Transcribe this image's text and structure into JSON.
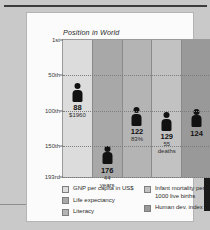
{
  "figure": {
    "title": "Position in World"
  },
  "chart_data": {
    "type": "bar",
    "title": "Position in World",
    "xlabel": "",
    "ylabel": "Position in World",
    "ylim": [
      1,
      193
    ],
    "grid": true,
    "legend_position": "bottom",
    "y_ticks": [
      {
        "label": "1st",
        "value": 1
      },
      {
        "label": "50th",
        "value": 50
      },
      {
        "label": "100th",
        "value": 100
      },
      {
        "label": "150th",
        "value": 150
      },
      {
        "label": "193rd",
        "value": 193
      }
    ],
    "categories": [
      "GNP per capita in US$",
      "Life expectancy",
      "Literacy",
      "Infant mortality per 1000 live births",
      "Human dev. index"
    ],
    "values": [
      88,
      176,
      122,
      129,
      124
    ],
    "point_labels": [
      {
        "rank": "88",
        "sub1": "$1960",
        "sub2": ""
      },
      {
        "rank": "176",
        "sub1": "44",
        "sub2": "years"
      },
      {
        "rank": "122",
        "sub1": "83%",
        "sub2": ""
      },
      {
        "rank": "129",
        "sub1": "55",
        "sub2": "deaths"
      },
      {
        "rank": "124",
        "sub1": "",
        "sub2": ""
      }
    ],
    "column_colors": [
      "#dcdcdc",
      "#a8a8a8",
      "#b4b4b4",
      "#c2c2c2",
      "#999999"
    ]
  },
  "legend": {
    "left": [
      {
        "label": "GNP per capita in US$",
        "color": "#dcdcdc"
      },
      {
        "label": "Life expectancy",
        "color": "#a8a8a8"
      },
      {
        "label": "Literacy",
        "color": "#b4b4b4"
      }
    ],
    "right": [
      {
        "label": "Infant mortality per 1000 live births",
        "color": "#c2c2c2"
      },
      {
        "label": "Human dev. index",
        "color": "#999999"
      }
    ]
  }
}
